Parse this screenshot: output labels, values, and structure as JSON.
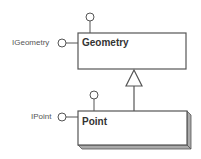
{
  "diagram": {
    "type": "UML class/interface diagram",
    "classes": [
      {
        "name": "Geometry",
        "interfaces": [
          "IGeometry"
        ],
        "style": "plain box"
      },
      {
        "name": "Point",
        "interfaces": [
          "IPoint"
        ],
        "style": "3d box",
        "inherits_from": "Geometry"
      }
    ],
    "interface_labels": {
      "geometry": "IGeometry",
      "point": "IPoint"
    },
    "relationships": [
      {
        "type": "inheritance",
        "from": "Point",
        "to": "Geometry"
      }
    ],
    "colors": {
      "stroke": "#555555",
      "fill": "#ffffff",
      "shadow": "#aaaaaa",
      "text": "#333333"
    }
  }
}
